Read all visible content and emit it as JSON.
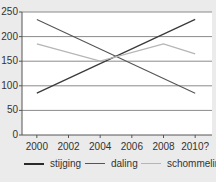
{
  "chart_data": {
    "type": "line",
    "title": "",
    "xlabel": "",
    "ylabel": "",
    "categories": [
      "2000",
      "2002",
      "2004",
      "2006",
      "2008",
      "2010?"
    ],
    "x": [
      2000,
      2002,
      2004,
      2006,
      2008,
      2010
    ],
    "yticks": [
      0,
      50,
      100,
      150,
      200,
      250
    ],
    "ylim": [
      0,
      250
    ],
    "grid": true,
    "legend_position": "bottom",
    "series": [
      {
        "name": "stijging",
        "color": "#3a3a3a",
        "x": [
          2000,
          2010
        ],
        "values": [
          85,
          235
        ]
      },
      {
        "name": "daling",
        "color": "#555555",
        "x": [
          2000,
          2010
        ],
        "values": [
          235,
          85
        ]
      },
      {
        "name": "schommeling",
        "color": "#b5b5b5",
        "x": [
          2000,
          2004,
          2008,
          2010
        ],
        "values": [
          185,
          150,
          185,
          165
        ]
      }
    ]
  },
  "legend": {
    "items": [
      {
        "label": "stijging",
        "color": "#2a2a2a"
      },
      {
        "label": "daling",
        "color": "#555555"
      },
      {
        "label": "schommeling",
        "color": "#b5b5b5"
      }
    ]
  },
  "colors": {
    "background": "#ebebeb",
    "plot_background": "#ffffff",
    "gridline": "#8a8a8a",
    "axis": "#555555"
  }
}
